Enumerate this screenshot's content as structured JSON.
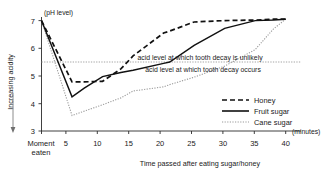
{
  "chart_data": {
    "type": "line",
    "title": "",
    "xlabel": "Time passed after eating sugar/honey",
    "xunit": "(minutes)",
    "ylabel": "Increasing acidity",
    "yunit": "(pH level)",
    "xlim": [
      0,
      42
    ],
    "ylim": [
      3,
      7.25
    ],
    "grid": false,
    "legend_position": "inside-bottom-right",
    "x_ticks": [
      0,
      5,
      10,
      15,
      20,
      25,
      30,
      35,
      40
    ],
    "x_tick_labels": [
      "Moment eaten",
      "5",
      "10",
      "15",
      "20",
      "25",
      "30",
      "35",
      "40"
    ],
    "x_first_tick_line1": "Moment",
    "x_first_tick_line2": "eaten",
    "y_ticks": [
      3,
      4,
      5,
      6,
      7
    ],
    "y_tick_labels": [
      "3",
      "4",
      "5",
      "6",
      "7"
    ],
    "x": [
      0,
      5,
      7,
      10,
      13,
      15,
      20,
      21,
      25,
      30,
      35,
      38,
      40
    ],
    "series": [
      {
        "name": "Honey",
        "style": "dashed",
        "color": "#111111",
        "values": [
          7.0,
          4.78,
          4.78,
          4.8,
          5.25,
          5.72,
          6.55,
          6.62,
          6.95,
          7.0,
          7.02,
          7.05,
          7.05
        ]
      },
      {
        "name": "Fruit sugar",
        "style": "solid",
        "color": "#111111",
        "values": [
          7.0,
          4.24,
          4.55,
          4.97,
          5.12,
          5.2,
          5.45,
          5.5,
          6.1,
          6.72,
          7.0,
          7.02,
          7.05
        ]
      },
      {
        "name": "Cane sugar",
        "style": "dotted",
        "color": "#9a9a9a",
        "values": [
          7.0,
          3.56,
          3.72,
          3.95,
          4.2,
          4.45,
          4.6,
          4.68,
          4.95,
          5.35,
          5.95,
          6.7,
          7.05
        ]
      }
    ],
    "reference_lines": [
      {
        "value": 5.5,
        "style": "dotted",
        "color": "#9a9a9a",
        "label_above": "acid level at which tooth decay is unlikely",
        "label_below": "acid level at which tooth decay occurs"
      }
    ],
    "annotations": [
      {
        "text": "acid level at which tooth decay is unlikely",
        "x": 20.5,
        "y": 5.72
      },
      {
        "text": "acid level at which tooth decay occurs",
        "x": 21.5,
        "y": 5.25
      }
    ],
    "legend": [
      {
        "label": "Honey",
        "style": "dashed",
        "color": "#111111"
      },
      {
        "label": "Fruit sugar",
        "style": "solid",
        "color": "#111111"
      },
      {
        "label": "Cane sugar",
        "style": "dotted",
        "color": "#9a9a9a"
      }
    ]
  }
}
